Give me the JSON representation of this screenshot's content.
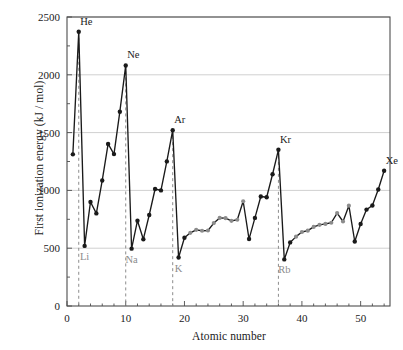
{
  "chart_data": {
    "type": "line",
    "title": "",
    "xlabel": "Atomic number",
    "ylabel": "First ionization energy (kJ / mol)",
    "xlim": [
      0,
      55
    ],
    "ylim": [
      0,
      2500
    ],
    "xticks": [
      0,
      10,
      20,
      30,
      40,
      50
    ],
    "yticks": [
      0,
      500,
      1000,
      1500,
      2000,
      2500
    ],
    "xtick_labels": [
      "0",
      "10",
      "20",
      "30",
      "40",
      "50"
    ],
    "ytick_labels": [
      "0",
      "500",
      "1000",
      "1500",
      "2000",
      "2500"
    ],
    "grid": "horizontal",
    "legend": "none",
    "x": [
      1,
      2,
      3,
      4,
      5,
      6,
      7,
      8,
      9,
      10,
      11,
      12,
      13,
      14,
      15,
      16,
      17,
      18,
      19,
      20,
      21,
      22,
      23,
      24,
      25,
      26,
      27,
      28,
      29,
      30,
      31,
      32,
      33,
      34,
      35,
      36,
      37,
      38,
      39,
      40,
      41,
      42,
      43,
      44,
      45,
      46,
      47,
      48,
      49,
      50,
      51,
      52,
      53,
      54
    ],
    "values": [
      1312,
      2372,
      520,
      900,
      801,
      1086,
      1402,
      1314,
      1681,
      2081,
      496,
      738,
      578,
      787,
      1012,
      1000,
      1251,
      1521,
      419,
      590,
      633,
      659,
      651,
      653,
      717,
      762,
      760,
      737,
      746,
      906,
      579,
      762,
      947,
      941,
      1140,
      1351,
      403,
      550,
      600,
      640,
      652,
      684,
      702,
      710,
      720,
      804,
      731,
      868,
      558,
      709,
      834,
      869,
      1008,
      1170
    ],
    "element_symbols": [
      "H",
      "He",
      "Li",
      "Be",
      "B",
      "C",
      "N",
      "O",
      "F",
      "Ne",
      "Na",
      "Mg",
      "Al",
      "Si",
      "P",
      "S",
      "Cl",
      "Ar",
      "K",
      "Ca",
      "Sc",
      "Ti",
      "V",
      "Cr",
      "Mn",
      "Fe",
      "Co",
      "Ni",
      "Cu",
      "Zn",
      "Ga",
      "Ge",
      "As",
      "Se",
      "Br",
      "Kr",
      "Rb",
      "Sr",
      "Y",
      "Zr",
      "Nb",
      "Mo",
      "Tc",
      "Ru",
      "Rh",
      "Pd",
      "Ag",
      "Cd",
      "In",
      "Sn",
      "Sb",
      "Te",
      "I",
      "Xe"
    ],
    "transition_metal_x": [
      21,
      22,
      23,
      24,
      25,
      26,
      27,
      28,
      29,
      30,
      39,
      40,
      41,
      42,
      43,
      44,
      45,
      46,
      47,
      48
    ],
    "annotations": [
      {
        "label": "He",
        "x": 2,
        "y": 2372,
        "kind": "noble-gas-peak"
      },
      {
        "label": "Ne",
        "x": 10,
        "y": 2081,
        "kind": "noble-gas-peak"
      },
      {
        "label": "Ar",
        "x": 18,
        "y": 1521,
        "kind": "noble-gas-peak"
      },
      {
        "label": "Kr",
        "x": 36,
        "y": 1351,
        "kind": "noble-gas-peak"
      },
      {
        "label": "Xe",
        "x": 54,
        "y": 1170,
        "kind": "noble-gas-peak"
      },
      {
        "label": "Li",
        "x": 3,
        "y": 520,
        "kind": "alkali-metal-minimum"
      },
      {
        "label": "Na",
        "x": 11,
        "y": 496,
        "kind": "alkali-metal-minimum"
      },
      {
        "label": "K",
        "x": 19,
        "y": 419,
        "kind": "alkali-metal-minimum"
      },
      {
        "label": "Rb",
        "x": 37,
        "y": 403,
        "kind": "alkali-metal-minimum"
      }
    ],
    "drop_lines": [
      {
        "from_label": "He",
        "x": 2
      },
      {
        "from_label": "Ne",
        "x": 10
      },
      {
        "from_label": "Ar",
        "x": 18
      },
      {
        "from_label": "Kr",
        "x": 36
      }
    ],
    "colors": {
      "line": "#1a1a1a",
      "marker_main_group": "#1a1a1a",
      "marker_transition_metal": "#8c8c8c",
      "drop_line": "#8c8c8c",
      "grid": "#d0d0d0",
      "axis": "#4d4d4d",
      "peak_label": "#1a1a1a",
      "trough_label": "#8c8c8c",
      "background": "#ffffff"
    }
  }
}
